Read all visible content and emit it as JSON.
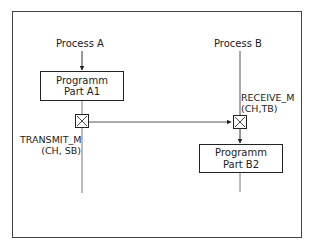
{
  "diagram": {
    "process_a": {
      "label": "Process A"
    },
    "process_b": {
      "label": "Process B"
    },
    "box_a1": {
      "line1": "Programm",
      "line2": "Part A1"
    },
    "box_b2": {
      "line1": "Programm",
      "line2": "Part B2"
    },
    "transmit": {
      "line1": "TRANSMIT_M",
      "line2": "(CH, SB)"
    },
    "receive": {
      "line1": "RECEIVE_M",
      "line2": "(CH,TB)"
    },
    "colors": {
      "line": "#555555",
      "stroke": "#222222",
      "frame": "#444444"
    }
  }
}
